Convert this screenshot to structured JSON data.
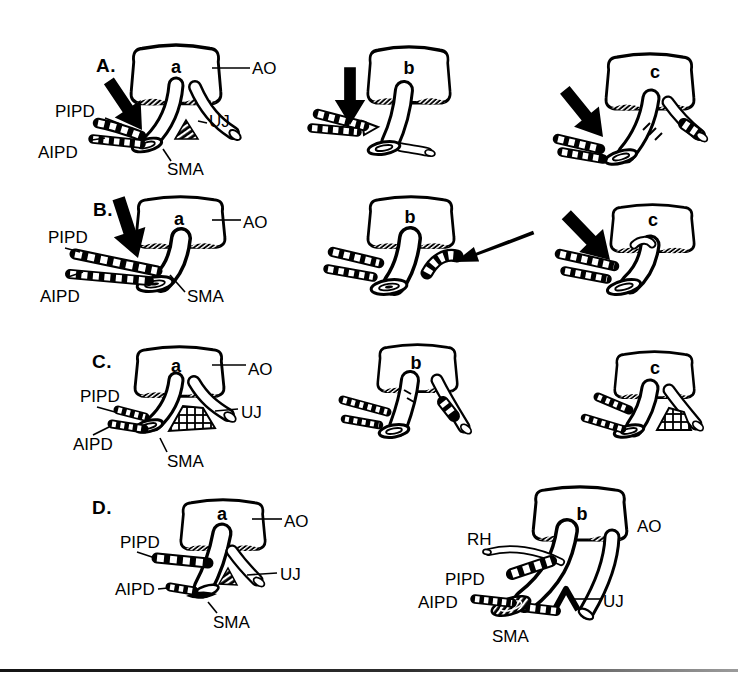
{
  "figure": {
    "rows": {
      "A": {
        "row_label": "A.",
        "panels": {
          "a": {
            "letter": "a",
            "labels": {
              "ao": "AO",
              "pipd": "PIPD",
              "aipd": "AIPD",
              "uj": "UJ",
              "sma": "SMA"
            }
          },
          "b": {
            "letter": "b"
          },
          "c": {
            "letter": "c"
          }
        }
      },
      "B": {
        "row_label": "B.",
        "panels": {
          "a": {
            "letter": "a",
            "labels": {
              "ao": "AO",
              "pipd": "PIPD",
              "aipd": "AIPD",
              "sma": "SMA"
            }
          },
          "b": {
            "letter": "b"
          },
          "c": {
            "letter": "c"
          }
        }
      },
      "C": {
        "row_label": "C.",
        "panels": {
          "a": {
            "letter": "a",
            "labels": {
              "ao": "AO",
              "pipd": "PIPD",
              "aipd": "AIPD",
              "uj": "UJ",
              "sma": "SMA"
            }
          },
          "b": {
            "letter": "b"
          },
          "c": {
            "letter": "c"
          }
        }
      },
      "D": {
        "row_label": "D.",
        "panels": {
          "a": {
            "letter": "a",
            "labels": {
              "ao": "AO",
              "pipd": "PIPD",
              "aipd": "AIPD",
              "uj": "UJ",
              "sma": "SMA"
            }
          },
          "b": {
            "letter": "b",
            "labels": {
              "rh": "RH",
              "ao": "AO",
              "pipd": "PIPD",
              "aipd": "AIPD",
              "uj": "UJ",
              "sma": "SMA"
            }
          }
        }
      }
    }
  }
}
